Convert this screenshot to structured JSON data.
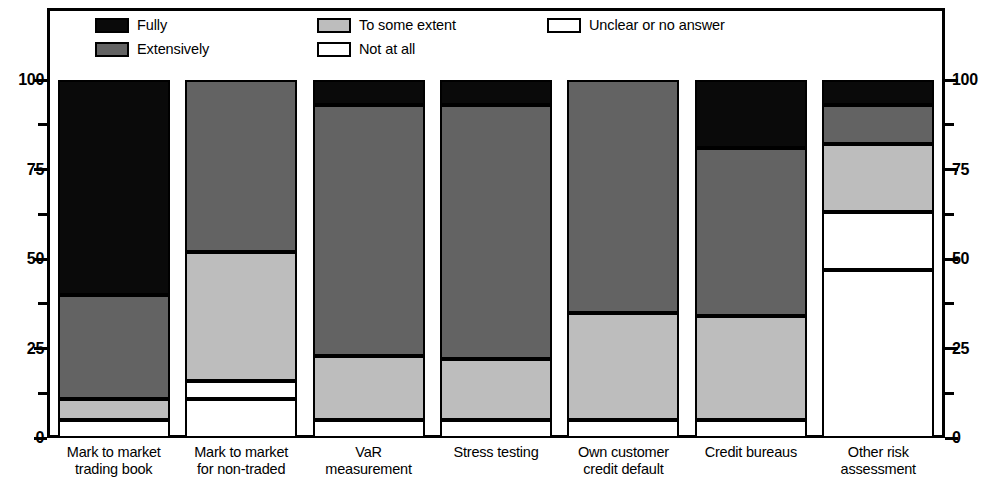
{
  "chart_data": {
    "type": "bar",
    "subtype": "stacked-bar-100-percent",
    "title": "",
    "subtitle": "",
    "xlabel": "",
    "ylabel": "",
    "ylim": [
      0,
      100
    ],
    "yticks": [
      0,
      25,
      50,
      75,
      100
    ],
    "ytick_labels": [
      "0",
      "25",
      "50",
      "75",
      "100"
    ],
    "yticks_minor": [
      12.5,
      37.5,
      62.5,
      87.5
    ],
    "grid": false,
    "dual_axis": true,
    "right_axis_ticks": [
      0,
      25,
      50,
      75,
      100
    ],
    "right_axis_tick_labels": [
      "0",
      "25",
      "50",
      "75",
      "100"
    ],
    "legend_position": "top-inside",
    "categories": [
      "Mark to market trading book",
      "Mark to market for non-traded",
      "VaR measurement",
      "Stress testing",
      "Own customer credit default",
      "Credit bureaus",
      "Other risk assessment"
    ],
    "category_lines": [
      [
        "Mark to market",
        "trading book"
      ],
      [
        "Mark to market",
        "for non-traded"
      ],
      [
        "VaR",
        "measurement"
      ],
      [
        "Stress testing",
        ""
      ],
      [
        "Own customer",
        "credit default"
      ],
      [
        "Credit bureaus",
        ""
      ],
      [
        "Other risk",
        "assessment"
      ]
    ],
    "series": [
      {
        "name": "Not at all",
        "key": "notatall",
        "color": "#ffffff",
        "values": [
          5,
          11,
          5,
          5,
          5,
          5,
          47
        ]
      },
      {
        "name": "Unclear or no answer",
        "key": "unclear",
        "color": "#ffffff",
        "values": [
          0,
          5,
          0,
          0,
          0,
          0,
          16
        ]
      },
      {
        "name": "To some extent",
        "key": "some",
        "color": "#bdbdbd",
        "values": [
          6,
          36,
          18,
          17,
          30,
          29,
          19
        ]
      },
      {
        "name": "Extensively",
        "key": "extensive",
        "color": "#636363",
        "values": [
          29,
          48,
          70,
          71,
          65,
          47,
          11
        ]
      },
      {
        "name": "Fully",
        "key": "fully",
        "color": "#0a0a0a",
        "values": [
          60,
          0,
          7,
          7,
          0,
          19,
          7
        ]
      }
    ],
    "cumulative_boundaries": [
      [
        5,
        5,
        11,
        40,
        100
      ],
      [
        11,
        16,
        52,
        100,
        100
      ],
      [
        5,
        5,
        23,
        93,
        100
      ],
      [
        5,
        5,
        22,
        93,
        100
      ],
      [
        5,
        5,
        35,
        100,
        100
      ],
      [
        5,
        5,
        34,
        81,
        100
      ],
      [
        47,
        63,
        82,
        93,
        100
      ]
    ]
  },
  "legend": {
    "rows": [
      [
        {
          "label": "Fully",
          "swatch": "#0a0a0a"
        },
        {
          "label": "To some extent",
          "swatch": "#bdbdbd"
        },
        {
          "label": "Unclear or no answer",
          "swatch": "#ffffff"
        }
      ],
      [
        {
          "label": "Extensively",
          "swatch": "#636363"
        },
        {
          "label": "Not at all",
          "swatch": "#ffffff"
        }
      ]
    ]
  }
}
